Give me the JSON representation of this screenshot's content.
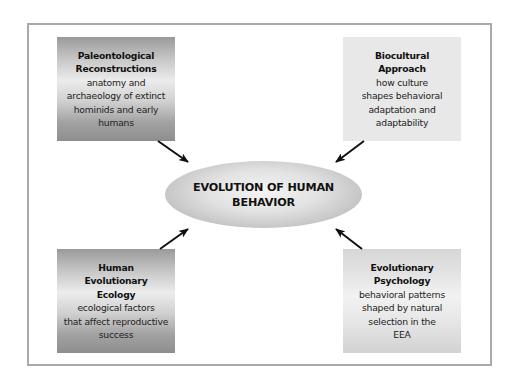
{
  "diagram": {
    "center": {
      "line1": "EVOLUTION OF HUMAN",
      "line2": "BEHAVIOR"
    },
    "boxes": [
      {
        "position": "top-left",
        "title": [
          "Paleontological",
          "Reconstructions"
        ],
        "description": [
          "anatomy and",
          "archaeology of extinct",
          "hominids and early",
          "humans"
        ],
        "style": "dark-gradient"
      },
      {
        "position": "top-right",
        "title": [
          "Biocultural",
          "Approach"
        ],
        "description": [
          "how culture",
          "shapes behavioral",
          "adaptation and",
          "adaptability"
        ],
        "style": "flat-light"
      },
      {
        "position": "bottom-left",
        "title": [
          "Human",
          "Evolutionary",
          "Ecology"
        ],
        "description": [
          "ecological factors",
          "that affect reproductive",
          "success"
        ],
        "style": "dark-gradient"
      },
      {
        "position": "bottom-right",
        "title": [
          "Evolutionary",
          "Psychology"
        ],
        "description": [
          "behavioral patterns",
          "shaped by natural",
          "selection in the",
          "EEA"
        ],
        "style": "light-gradient"
      }
    ],
    "arrows": [
      {
        "from": "top-left",
        "to": "center"
      },
      {
        "from": "top-right",
        "to": "center"
      },
      {
        "from": "bottom-left",
        "to": "center"
      },
      {
        "from": "bottom-right",
        "to": "center"
      }
    ],
    "colors": {
      "frame_border": "#a9a9a9",
      "arrow": "#111111",
      "text": "#111111"
    }
  }
}
